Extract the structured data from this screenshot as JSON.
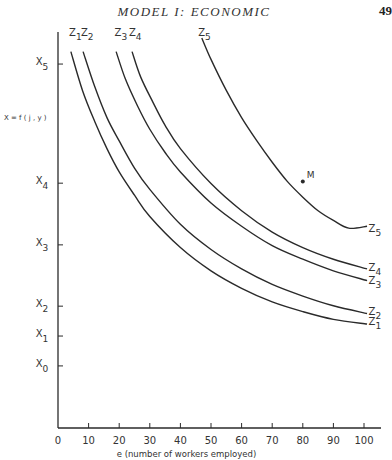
{
  "page": {
    "running_title": "MODEL I: ECONOMIC",
    "page_number": "49"
  },
  "chart_data": {
    "type": "line",
    "title": "",
    "xlabel": "e (number of workers employed)",
    "ylabel": "X = f ( j , y )",
    "xlim": [
      0,
      105
    ],
    "ylim": [
      0,
      100
    ],
    "grid": false,
    "x_ticks": [
      0,
      10,
      20,
      30,
      40,
      50,
      60,
      70,
      80,
      90,
      100
    ],
    "x_tick_labels": [
      "0",
      "10",
      "20",
      "30",
      "40",
      "50",
      "60",
      "70",
      "80",
      "90",
      "100"
    ],
    "y_ticks": [
      {
        "label": "X",
        "sub": "0",
        "value": 16.0
      },
      {
        "label": "X",
        "sub": "1",
        "value": 23.7
      },
      {
        "label": "X",
        "sub": "2",
        "value": 31.4
      },
      {
        "label": "X",
        "sub": "3",
        "value": 47.2
      },
      {
        "label": "X",
        "sub": "4",
        "value": 63.1
      },
      {
        "label": "X",
        "sub": "5",
        "value": 93.8
      }
    ],
    "series": [
      {
        "name": "Z1",
        "label": "Z",
        "sub": "1",
        "top_label_pos": [
          3.6,
          101
        ],
        "end_label_pos": [
          101.5,
          26.5
        ],
        "points": [
          [
            4.2,
            97
          ],
          [
            8,
            87
          ],
          [
            12,
            79
          ],
          [
            16,
            72
          ],
          [
            20,
            66
          ],
          [
            25,
            60
          ],
          [
            30,
            54.5
          ],
          [
            40,
            46.5
          ],
          [
            50,
            40.5
          ],
          [
            60,
            36
          ],
          [
            70,
            32.5
          ],
          [
            80,
            30
          ],
          [
            90,
            28
          ],
          [
            101,
            26.8
          ]
        ]
      },
      {
        "name": "Z2",
        "label": "Z",
        "sub": "2",
        "top_label_pos": [
          7.5,
          101
        ],
        "end_label_pos": [
          101.5,
          29
        ],
        "points": [
          [
            8.2,
            97
          ],
          [
            12,
            88
          ],
          [
            16,
            80
          ],
          [
            20,
            74
          ],
          [
            25,
            67
          ],
          [
            30,
            61.5
          ],
          [
            40,
            52.5
          ],
          [
            50,
            46
          ],
          [
            60,
            41
          ],
          [
            70,
            37
          ],
          [
            80,
            34
          ],
          [
            90,
            31.5
          ],
          [
            101,
            29.5
          ]
        ]
      },
      {
        "name": "Z3",
        "label": "Z",
        "sub": "3",
        "top_label_pos": [
          18.5,
          101
        ],
        "end_label_pos": [
          101.5,
          37
        ],
        "points": [
          [
            19,
            97
          ],
          [
            22,
            90
          ],
          [
            26,
            83
          ],
          [
            30,
            77
          ],
          [
            35,
            71
          ],
          [
            40,
            66
          ],
          [
            50,
            58
          ],
          [
            60,
            52
          ],
          [
            70,
            47
          ],
          [
            80,
            43.5
          ],
          [
            90,
            40.5
          ],
          [
            101,
            38
          ]
        ]
      },
      {
        "name": "Z4",
        "label": "Z",
        "sub": "4",
        "top_label_pos": [
          23.2,
          101
        ],
        "end_label_pos": [
          101.5,
          40.5
        ],
        "points": [
          [
            24.2,
            97
          ],
          [
            27,
            90.5
          ],
          [
            31,
            84
          ],
          [
            35,
            78
          ],
          [
            40,
            72
          ],
          [
            50,
            63
          ],
          [
            60,
            56
          ],
          [
            70,
            50.5
          ],
          [
            80,
            46.5
          ],
          [
            90,
            43.5
          ],
          [
            101,
            41
          ]
        ]
      },
      {
        "name": "Z5",
        "label": "Z",
        "sub": "5",
        "top_label_pos": [
          45.8,
          101
        ],
        "end_label_pos": [
          101.5,
          50.5
        ],
        "points": [
          [
            47,
            100.5
          ],
          [
            50,
            95
          ],
          [
            55,
            87
          ],
          [
            60,
            80
          ],
          [
            65,
            74
          ],
          [
            70,
            68.5
          ],
          [
            75,
            63.5
          ],
          [
            80,
            59.5
          ],
          [
            85,
            56
          ],
          [
            90,
            53.5
          ],
          [
            95,
            51.5
          ],
          [
            101,
            52
          ]
        ]
      }
    ],
    "annotations": [
      {
        "text": "M",
        "point": [
          80,
          63.5
        ],
        "marker": "dot"
      }
    ]
  }
}
